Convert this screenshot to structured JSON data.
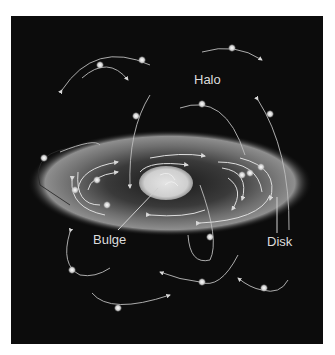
{
  "diagram": {
    "background_color": "#0c0c0c",
    "labels": {
      "halo": "Halo",
      "bulge": "Bulge",
      "disk": "Disk"
    },
    "components": [
      {
        "id": "halo",
        "label": "Halo",
        "description": "Stars on random, inclined orbits surrounding the galaxy"
      },
      {
        "id": "disk",
        "label": "Disk",
        "description": "Flattened glowing ellipse with stars orbiting in circular paths"
      },
      {
        "id": "bulge",
        "label": "Bulge",
        "description": "Bright central ellipsoid"
      }
    ],
    "colors": {
      "disk_glow": "#8a8a8a",
      "bulge": "#d8d8d8",
      "orbit_line": "#cfcfcf",
      "star": "#e6e6e6",
      "label_text": "#dcdcdc"
    }
  }
}
